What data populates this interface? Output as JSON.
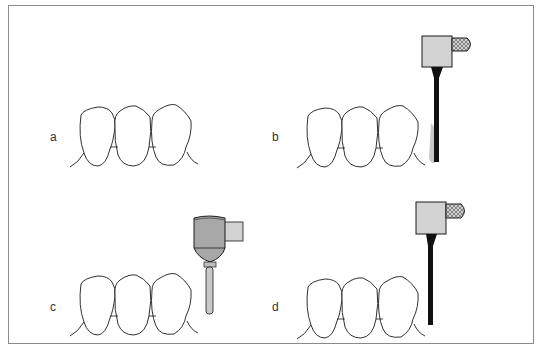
{
  "figure": {
    "panels": [
      {
        "id": "a",
        "label": "a",
        "instrument": "none"
      },
      {
        "id": "b",
        "label": "b",
        "instrument": "ultrasonic-scaler"
      },
      {
        "id": "c",
        "label": "c",
        "instrument": "handpiece-with-bur"
      },
      {
        "id": "d",
        "label": "d",
        "instrument": "ultrasonic-scaler"
      }
    ]
  },
  "colors": {
    "outline": "#1a1a1a",
    "frame": "#8a8a8a",
    "instrument_fill": "#d0d0d0",
    "handpiece_fill": "#a8a8a8",
    "shaft": "#111111",
    "shading": "#c8c8c8"
  }
}
